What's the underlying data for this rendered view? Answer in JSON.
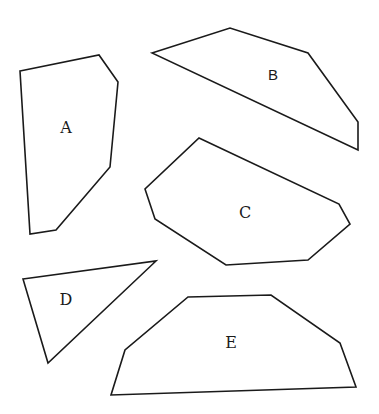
{
  "diagram": {
    "stroke_color": "#1a1a1a",
    "background": "#ffffff",
    "shapes": [
      {
        "label": "A",
        "sides": 6,
        "points": "20,71 99,55 118,82 110,167 56,230 30,234",
        "label_pos": [
          66,
          133
        ],
        "label_font": "serif"
      },
      {
        "label": "B",
        "sides": 5,
        "points": "152,53 230,28 308,53 358,122 358,150",
        "label_pos": [
          273,
          80
        ],
        "label_font": "sans"
      },
      {
        "label": "C",
        "sides": 7,
        "points": "199,138 339,204 350,224 308,260 226,265 155,219 145,189",
        "label_pos": [
          245,
          218
        ],
        "label_font": "serif"
      },
      {
        "label": "D",
        "sides": 3,
        "points": "23,279 156,261 48,363",
        "label_pos": [
          66,
          305
        ],
        "label_font": "serif"
      },
      {
        "label": "E",
        "sides": 6,
        "points": "188,297 271,295 340,343 356,387 111,395 125,350",
        "label_pos": [
          231,
          348
        ],
        "label_font": "serif"
      }
    ]
  }
}
